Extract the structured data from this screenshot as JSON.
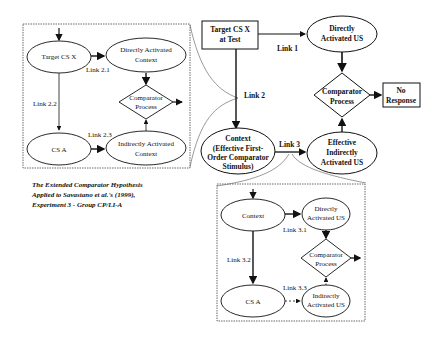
{
  "diagram": {
    "main": {
      "target": "Target CS X|at Test",
      "direct_us": "Directly|Activated US",
      "comparator": "Comparator|Process",
      "no_response": "No|Response",
      "context": "Context|(Effective First-|Order Comparator|Stimulus)",
      "indirect_us": "Effective|Indirectly|Activated US",
      "link1": "Link 1",
      "link2": "Link 2",
      "link3": "Link 3"
    },
    "left_box": {
      "target": "Target CS X",
      "direct_ctx": "Directly Activated|Context",
      "comparator": "Comparator|Process",
      "cs_a": "CS A",
      "indirect_ctx": "Indirectly Activated|Context",
      "link21": "Link 2.1",
      "link22": "Link 2.2",
      "link23": "Link 2.3"
    },
    "right_box": {
      "context": "Context",
      "direct_us": "Directly|Activated US",
      "comparator": "Comparator|Process",
      "cs_a": "CS A",
      "indirect_us": "Indirectly|Activated US",
      "link31": "Link 3.1",
      "link32": "Link 3.2",
      "link33": "Link 3.3"
    },
    "caption": [
      "The Extended Comparator Hypothesis",
      "Applied to Savastano et al.'s (1999),",
      "Experiment 3 - Group CP/LI-A"
    ]
  }
}
